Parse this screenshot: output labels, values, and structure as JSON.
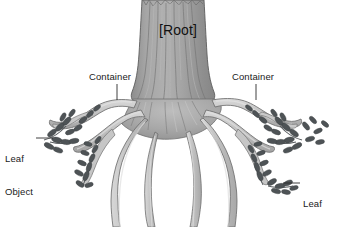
{
  "diagram": {
    "title": "[Root]",
    "background_color": "#ffffff",
    "width": 346,
    "height": 227,
    "labels": {
      "root": "[Root]",
      "container_left": "Container",
      "container_right": "Container",
      "leaf_left_line1": "Leaf",
      "leaf_left_line2": "Object",
      "leaf_right_line1": "Leaf",
      "leaf_right_line2": "Object"
    },
    "colors": {
      "trunk_fill": "#a0a0a0",
      "trunk_shade": "#8a8a8a",
      "trunk_highlight": "#b4b4b4",
      "trunk_stroke": "#5c5c5c",
      "root_fill": "#c3c3c3",
      "root_highlight": "#dcdcdc",
      "root_shade": "#a8a8a8",
      "root_stroke": "#6e6e6e",
      "leaf_fill": "#4e5356",
      "leaf_stroke": "#3b4042",
      "leader_line": "#2a2a2a",
      "text": "#1a1a1a"
    }
  }
}
